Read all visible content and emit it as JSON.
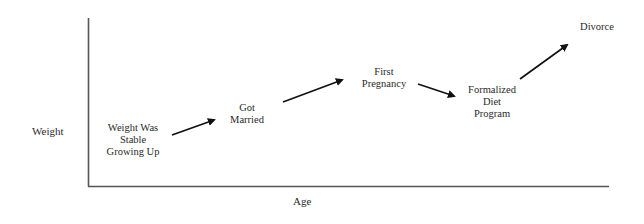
{
  "diagram": {
    "type": "annotated-timeline-axes",
    "axes": {
      "y_label": "Weight",
      "x_label": "Age"
    },
    "events": [
      {
        "id": "stable",
        "label": "Weight Was\nStable\nGrowing Up"
      },
      {
        "id": "married",
        "label": "Got\nMarried"
      },
      {
        "id": "pregnancy",
        "label": "First\nPregnancy"
      },
      {
        "id": "diet",
        "label": "Formalized\nDiet\nProgram"
      },
      {
        "id": "divorce",
        "label": "Divorce"
      }
    ],
    "arrows": [
      {
        "from": "stable",
        "to": "married",
        "direction": "up"
      },
      {
        "from": "married",
        "to": "pregnancy",
        "direction": "up"
      },
      {
        "from": "pregnancy",
        "to": "diet",
        "direction": "down"
      },
      {
        "from": "diet",
        "to": "divorce",
        "direction": "up"
      }
    ],
    "colors": {
      "axis": "#555555",
      "arrow": "#111111",
      "text": "#2a2a2a",
      "background": "#ffffff"
    }
  }
}
